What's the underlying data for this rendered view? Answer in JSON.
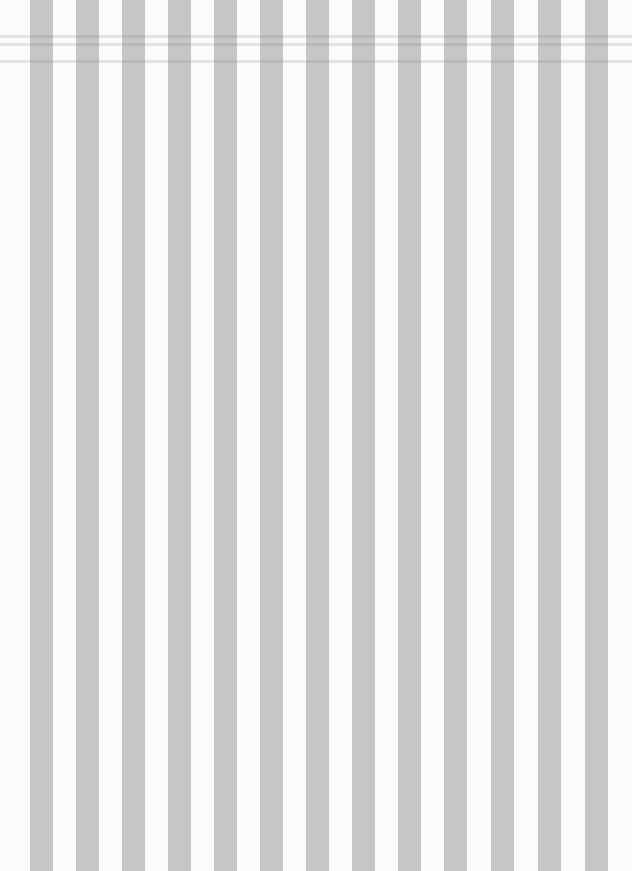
{
  "image": {
    "description": "Vertical gray and white striped pattern",
    "background_color": "#fbfbfb",
    "stripe_color": "#c6c6c6",
    "stripe_width_px": 23,
    "stripe_lefts": [
      30,
      76,
      122,
      168,
      214,
      260,
      306,
      352,
      398,
      444,
      491,
      538,
      585
    ],
    "creases_top_px": [
      35,
      43,
      60
    ]
  }
}
